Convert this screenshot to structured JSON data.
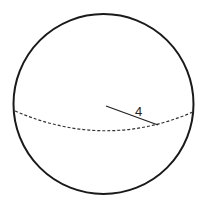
{
  "diagram": {
    "type": "sphere",
    "radius_label": "4",
    "colors": {
      "outline": "#1a1a1a",
      "equator": "#333333",
      "radius_line": "#222222",
      "background": "#ffffff"
    }
  }
}
